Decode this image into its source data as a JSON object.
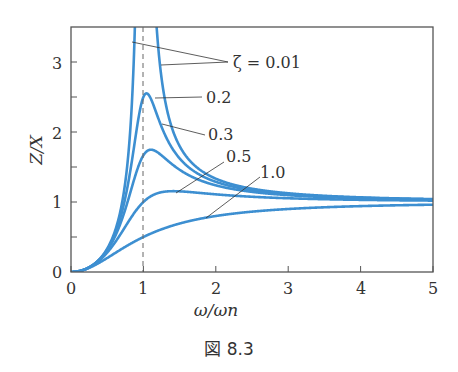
{
  "chart_data": {
    "type": "line",
    "title": "",
    "caption": "図 8.3",
    "xlabel": "ω/ωn",
    "ylabel": "Z/X",
    "xlim": [
      0,
      5
    ],
    "ylim": [
      0,
      3.5
    ],
    "x_ticks": [
      "0",
      "1",
      "2",
      "3",
      "4",
      "5"
    ],
    "y_ticks": [
      "0",
      "1",
      "2",
      "3"
    ],
    "grid": false,
    "reference_line": {
      "x": 1,
      "style": "dashed"
    },
    "formula": "Z/X = r^2 / sqrt((1 - r^2)^2 + (2*zeta*r)^2), r = ω/ωn",
    "series": [
      {
        "name": "ζ = 0.01",
        "zeta": 0.01,
        "peak": "unbounded near r=1"
      },
      {
        "name": "0.2",
        "zeta": 0.2,
        "peak_approx": 2.55
      },
      {
        "name": "0.3",
        "zeta": 0.3,
        "peak_approx": 1.72
      },
      {
        "name": "0.5",
        "zeta": 0.5,
        "peak_approx": 1.15
      },
      {
        "name": "1.0",
        "zeta": 1.0,
        "value_at_5_approx": 0.96
      }
    ],
    "labels": {
      "z001": "ζ = 0.01",
      "z02": "0.2",
      "z03": "0.3",
      "z05": "0.5",
      "z10": "1.0"
    },
    "color": "#3d8fd1"
  }
}
